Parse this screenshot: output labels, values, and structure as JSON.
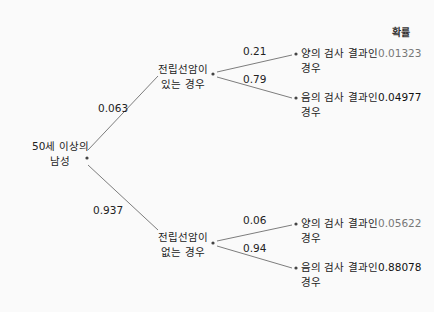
{
  "diagram": {
    "type": "probability-tree",
    "header": "확률",
    "root": {
      "label_line1": "50세 이상의",
      "label_line2": "남성"
    },
    "branches": [
      {
        "prob": "0.063",
        "node": {
          "label_line1": "전립선암이",
          "label_line2": "있는 경우"
        },
        "leaves": [
          {
            "prob": "0.21",
            "label_line1": "양의 검사 결과인",
            "label_line2": "경우",
            "joint": "0.01323"
          },
          {
            "prob": "0.79",
            "label_line1": "음의 검사 결과인",
            "label_line2": "경우",
            "joint": "0.04977"
          }
        ]
      },
      {
        "prob": "0.937",
        "node": {
          "label_line1": "전립선암이",
          "label_line2": "없는 경우"
        },
        "leaves": [
          {
            "prob": "0.06",
            "label_line1": "양의 검사 결과인",
            "label_line2": "경우",
            "joint": "0.05622"
          },
          {
            "prob": "0.94",
            "label_line1": "음의 검사 결과인",
            "label_line2": "경우",
            "joint": "0.88078"
          }
        ]
      }
    ]
  },
  "colors": {
    "line": "#6e6e6e",
    "text": "#222222",
    "gray_value": "#777777",
    "background": "#fafafa"
  }
}
